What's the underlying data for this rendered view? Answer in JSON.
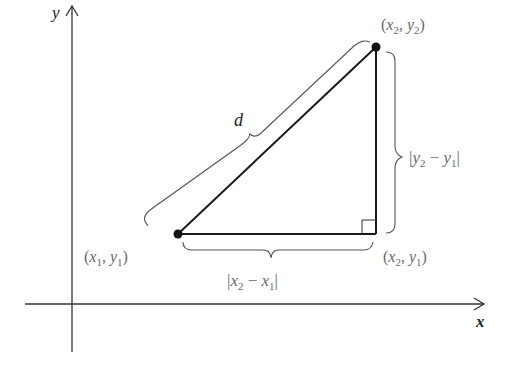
{
  "diagram": {
    "axes": {
      "x_label": "x",
      "y_label": "y"
    },
    "points": {
      "p1": {
        "label_open": "(",
        "x": "x",
        "x_sub": "1",
        "comma": ", ",
        "y": "y",
        "y_sub": "1",
        "label_close": ")"
      },
      "p2": {
        "label_open": "(",
        "x": "x",
        "x_sub": "2",
        "comma": ", ",
        "y": "y",
        "y_sub": "2",
        "label_close": ")"
      },
      "corner": {
        "label_open": "(",
        "x": "x",
        "x_sub": "2",
        "comma": ", ",
        "y": "y",
        "y_sub": "1",
        "label_close": ")"
      }
    },
    "distance_label": "d",
    "horizontal_length": {
      "bar_l": "|",
      "a": "x",
      "a_sub": "2",
      "minus": " − ",
      "b": "x",
      "b_sub": "1",
      "bar_r": "|"
    },
    "vertical_length": {
      "bar_l": "|",
      "a": "y",
      "a_sub": "2",
      "minus": " − ",
      "b": "y",
      "b_sub": "1",
      "bar_r": "|"
    },
    "colors": {
      "line": "#1a1a1a",
      "label": "#6a6a6a",
      "axis": "#333333"
    }
  }
}
